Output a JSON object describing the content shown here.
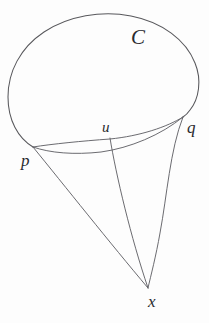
{
  "figure": {
    "kind": "geometric-diagram",
    "background_color": "#fdfdfd",
    "stroke_color": "#58585c",
    "label_color": "#2a2a2e",
    "width": 209,
    "height": 323,
    "labels": [
      {
        "id": "C",
        "text": "C",
        "x": 138,
        "y": 38,
        "role": "region-boundary-label"
      },
      {
        "id": "u",
        "text": "u",
        "x": 107,
        "y": 128,
        "role": "point-label"
      },
      {
        "id": "q",
        "text": "q",
        "x": 192,
        "y": 128,
        "role": "point-label"
      },
      {
        "id": "p",
        "text": "p",
        "x": 26,
        "y": 161,
        "role": "point-label"
      },
      {
        "id": "x",
        "text": "x",
        "x": 153,
        "y": 302,
        "role": "point-label"
      }
    ],
    "points": [
      {
        "id": "p",
        "x": 33,
        "y": 147
      },
      {
        "id": "q",
        "x": 183,
        "y": 117
      },
      {
        "id": "u",
        "x": 110,
        "y": 140
      },
      {
        "id": "x",
        "x": 148,
        "y": 288
      }
    ],
    "curves": [
      {
        "id": "closed-curve-C",
        "from": "p",
        "to": "q",
        "description": "closed oval boundary of region C, upper portion"
      },
      {
        "id": "lower-boundary-arc",
        "from": "p",
        "to": "q",
        "description": "lower boundary arc of region C from p to q"
      },
      {
        "id": "chord-arc-p-q",
        "from": "p",
        "to": "q",
        "description": "upper arc from p to q passing through u"
      },
      {
        "id": "geodesic-p-x",
        "from": "p",
        "to": "x",
        "description": "curve from p down to x"
      },
      {
        "id": "geodesic-u-x",
        "from": "u",
        "to": "x",
        "description": "curve from u down to x"
      },
      {
        "id": "geodesic-q-x",
        "from": "q",
        "to": "x",
        "description": "curve from q bowing right down to x"
      }
    ]
  }
}
